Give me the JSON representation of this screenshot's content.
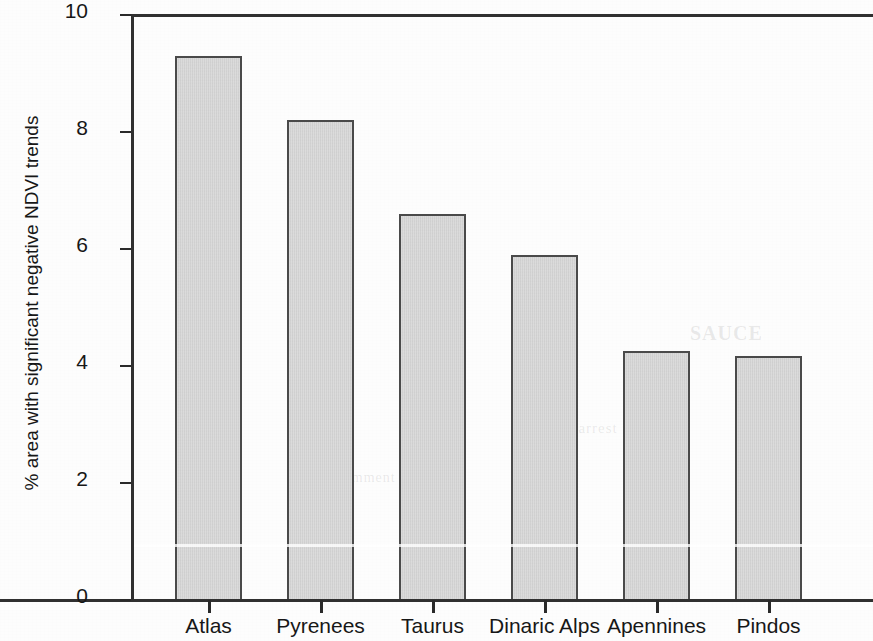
{
  "chart_data": {
    "type": "bar",
    "title": "",
    "subtitle": "",
    "xlabel": "",
    "ylabel": "% area with significant negative NDVI trends",
    "categories": [
      "Atlas",
      "Pyrenees",
      "Taurus",
      "Dinaric Alps",
      "Apennines",
      "Pindos"
    ],
    "values": [
      9.3,
      8.2,
      6.6,
      5.9,
      4.26,
      4.17
    ],
    "series": [
      {
        "name": "% area with significant negative NDVI trends",
        "values": [
          9.3,
          8.2,
          6.6,
          5.9,
          4.26,
          4.17
        ]
      }
    ],
    "ylim": [
      0,
      10
    ],
    "y_ticks": [
      0,
      2,
      4,
      6,
      8,
      10
    ],
    "y_tick_labels": [
      "0",
      "2",
      "4",
      "6",
      "8",
      "10"
    ],
    "grid": false,
    "legend": null,
    "legend_position": "none",
    "annotations": [],
    "bar_fill_color": "#d2d2d2",
    "bar_edge_color": "#4a4a4a",
    "axis_color": "#303030",
    "background_color": "#ffffff"
  },
  "ghost_text": {
    "a": "SAUCE",
    "b": "in arrest t",
    "c": "la comment",
    "d": "and ti"
  }
}
